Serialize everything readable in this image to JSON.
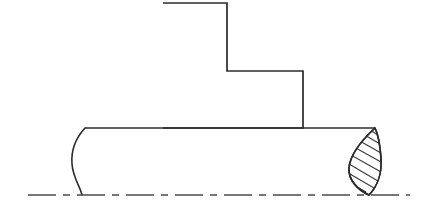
{
  "drawing": {
    "title": "Cylindrical shaft with L-shaped boss, conventional break symbols",
    "type": "engineering-orthographic-view",
    "canvas": {
      "width": 436,
      "height": 213
    },
    "style": {
      "background_color": "#ffffff",
      "line_color": "#2b2b2b",
      "hatch_color": "#3a3a3a",
      "center_line_color": "#4a4a4a",
      "outline_width": 1.7,
      "hatch_width": 1.05,
      "center_line_width": 1.4
    },
    "parts": [
      {
        "name": "l-shaped-boss",
        "label": "L-shaped stepped block",
        "outline_points": "163,3 227,3 227,71 303,71 303,128 163,128",
        "vertices": [
          {
            "x": 163,
            "y": 3
          },
          {
            "x": 227,
            "y": 3
          },
          {
            "x": 227,
            "y": 71
          },
          {
            "x": 303,
            "y": 71
          },
          {
            "x": 303,
            "y": 128
          },
          {
            "x": 163,
            "y": 128
          }
        ]
      },
      {
        "name": "cylinder-body",
        "label": "Cylindrical shaft half view",
        "top_edge": {
          "x1": 85,
          "y1": 128,
          "x2": 375,
          "y2": 128
        },
        "bottom_edge_is_center_line": true
      },
      {
        "name": "left-conventional-break",
        "label": "S-shaped conventional break line",
        "path": "M 85,128 C 74,140 71,152 72,164 C 73,178 80,186 82,195"
      },
      {
        "name": "right-revolved-section",
        "label": "Lens-shaped hatched revolved section (conventional break)",
        "top_point": {
          "x": 375,
          "y": 128
        },
        "bottom_point": {
          "x": 369,
          "y": 195
        },
        "outline_path": "M 375,128 C 362,140 350,155 349,168 C 348,180 358,190 369,195 C 378,186 382,172 381,158 C 380,144 378,134 375,128 Z",
        "hatch_angle_deg": 55,
        "hatch_line_count": 9,
        "hatch_segments": [
          {
            "x1": 352,
            "y1": 184,
            "x2": 366,
            "y2": 192
          },
          {
            "x1": 350,
            "y1": 174,
            "x2": 374,
            "y2": 188
          },
          {
            "x1": 349,
            "y1": 164,
            "x2": 378,
            "y2": 181
          },
          {
            "x1": 351,
            "y1": 155,
            "x2": 381,
            "y2": 172
          },
          {
            "x1": 354,
            "y1": 147,
            "x2": 381,
            "y2": 162
          },
          {
            "x1": 358,
            "y1": 140,
            "x2": 381,
            "y2": 153
          },
          {
            "x1": 363,
            "y1": 134,
            "x2": 380,
            "y2": 144
          },
          {
            "x1": 368,
            "y1": 129,
            "x2": 378,
            "y2": 135
          },
          {
            "x1": 356,
            "y1": 193,
            "x2": 362,
            "y2": 196
          }
        ]
      },
      {
        "name": "axis-center-line",
        "label": "Axis of revolution center line",
        "y": 195,
        "x_start": 28,
        "x_end": 410,
        "dash_pattern": "28 7 7 7"
      }
    ]
  }
}
